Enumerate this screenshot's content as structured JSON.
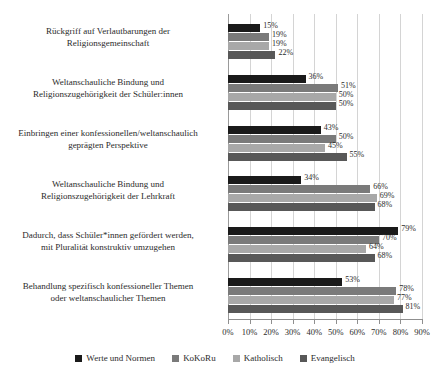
{
  "chart_data": {
    "type": "bar",
    "orientation": "horizontal",
    "title": "",
    "subtitle": "",
    "xlabel": "",
    "ylabel": "",
    "xlim": [
      0,
      90
    ],
    "grid": true,
    "legend_position": "bottom",
    "xticks": [
      "0%",
      "10%",
      "20%",
      "30%",
      "40%",
      "50%",
      "60%",
      "70%",
      "80%",
      "90%"
    ],
    "xtick_values": [
      0,
      10,
      20,
      30,
      40,
      50,
      60,
      70,
      80,
      90
    ],
    "categories": [
      "Rückgriff auf Verlautbarungen der Religionsgemeinschaft",
      "Weltanschauliche Bindung und Religionszugehörigkeit der Schüler:innen",
      "Einbringen einer konfessionellen/weltanschaulich geprägten Perspektive",
      "Weltanschauliche Bindung und Religionszugehörigkeit der Lehrkraft",
      "Dadurch, dass Schüler*innen gefördert werden, mit Pluralität konstruktiv umzugehen",
      "Behandlung spezifisch konfessioneller Themen oder weltanschaulicher Themen"
    ],
    "category_lines": [
      [
        "Rückgriff auf Verlautbarungen der",
        "Religionsgemeinschaft"
      ],
      [
        "Weltanschauliche Bindung und",
        "Religionszugehörigkeit der Schüler:innen"
      ],
      [
        "Einbringen einer konfessionellen/weltanschaulich",
        "geprägten Perspektive"
      ],
      [
        "Weltanschauliche Bindung und",
        "Religionszugehörigkeit der Lehrkraft"
      ],
      [
        "Dadurch, dass Schüler*innen gefördert werden,",
        "mit Pluralität konstruktiv umzugehen"
      ],
      [
        "Behandlung spezifisch konfessioneller Themen",
        "oder weltanschaulicher Themen"
      ]
    ],
    "series": [
      {
        "name": "Werte und Normen",
        "color": "#1a1a1a",
        "values": [
          15,
          36,
          43,
          34,
          79,
          53
        ],
        "labels": [
          "15%",
          "36%",
          "43%",
          "34%",
          "79%",
          "53%"
        ]
      },
      {
        "name": "KoKoRu",
        "color": "#7a7a7a",
        "values": [
          19,
          51,
          50,
          66,
          70,
          78
        ],
        "labels": [
          "19%",
          "51%",
          "50%",
          "66%",
          "70%",
          "78%"
        ]
      },
      {
        "name": "Katholisch",
        "color": "#a8a8a8",
        "values": [
          19,
          50,
          45,
          69,
          64,
          77
        ],
        "labels": [
          "19%",
          "50%",
          "45%",
          "69%",
          "64%",
          "77%"
        ]
      },
      {
        "name": "Evangelisch",
        "color": "#585858",
        "values": [
          22,
          50,
          55,
          68,
          68,
          81
        ],
        "labels": [
          "22%",
          "50%",
          "55%",
          "68%",
          "68%",
          "81%"
        ]
      }
    ]
  }
}
